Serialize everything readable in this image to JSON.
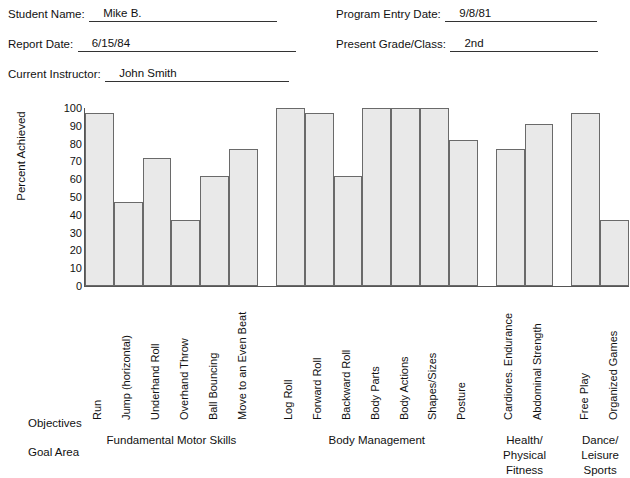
{
  "header": {
    "fields": [
      {
        "label": "Student Name:",
        "value": "Mike B."
      },
      {
        "label": "Report Date:",
        "value": "6/15/84"
      },
      {
        "label": "Current Instructor:",
        "value": "John Smith"
      },
      {
        "label": "Program Entry Date:",
        "value": "9/8/81"
      },
      {
        "label": "Present Grade/Class:",
        "value": "2nd"
      }
    ]
  },
  "footer": {
    "objectives_label": "Objectives",
    "goal_area_label": "Goal Area"
  },
  "chart_data": {
    "type": "bar",
    "title": "",
    "xlabel": "",
    "ylabel": "Percent Achieved",
    "ylim": [
      0,
      100
    ],
    "yticks": [
      100,
      90,
      80,
      70,
      60,
      50,
      40,
      30,
      20,
      10,
      0
    ],
    "grid": false,
    "legend": "none",
    "bar_color": "#e9e9e9",
    "bar_border_color": "#6a6a6a",
    "categories": [
      "Run",
      "Jump (horizontal)",
      "Underhand Roll",
      "Overhand Throw",
      "Ball Bouncing",
      "Move to an Even Beat",
      "Log Roll",
      "Forward Roll",
      "Backward Roll",
      "Body Parts",
      "Body Actions",
      "Shapes/Sizes",
      "Posture",
      "Cardiores. Endurance",
      "Abdominal Strength",
      "Free Play",
      "Organized Games"
    ],
    "values": [
      97,
      47,
      72,
      37,
      62,
      77,
      100,
      97,
      62,
      100,
      100,
      100,
      82,
      77,
      91,
      97,
      37
    ],
    "groups": [
      {
        "name": "Fundamental Motor Skills",
        "start": 0,
        "count": 6
      },
      {
        "name": "Body Management",
        "start": 6,
        "count": 7
      },
      {
        "name": "Health/\nPhysical\nFitness",
        "start": 13,
        "count": 2
      },
      {
        "name": "Dance/\nLeisure\nSports",
        "start": 15,
        "count": 2
      }
    ]
  }
}
